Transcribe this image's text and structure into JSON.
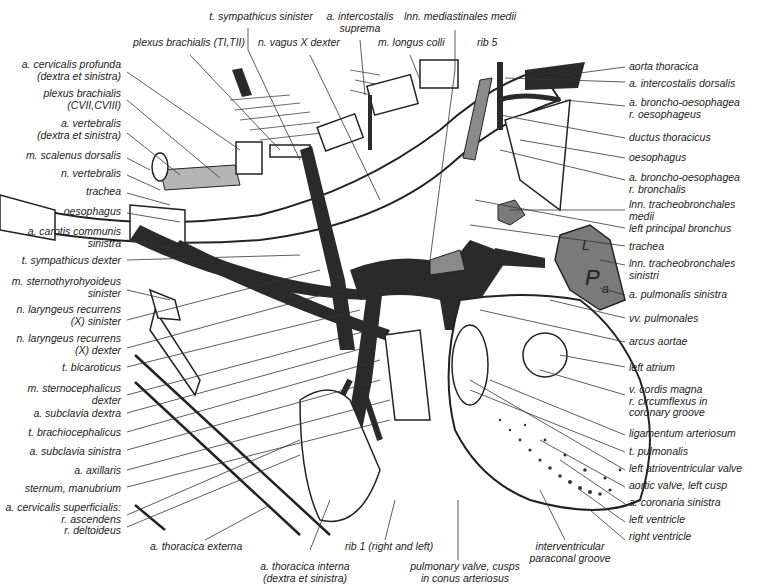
{
  "figure": {
    "colors": {
      "vessel": "#2a2a2a",
      "grey_structure": "#7a7a7a",
      "light_grey": "#b5b5b5",
      "line": "#222222",
      "background": "#ffffff"
    },
    "labels_left": [
      {
        "id": "a-cervicalis-profunda",
        "lines": [
          "a. cervicalis profunda",
          "(dextra et sinistra)"
        ]
      },
      {
        "id": "plexus-brachialis-cvii",
        "lines": [
          "plexus brachialis",
          "(CVII,CVIII)"
        ]
      },
      {
        "id": "a-vertebralis",
        "lines": [
          "a. vertebralis",
          "(dextra et sinistra)"
        ]
      },
      {
        "id": "m-scalenus-dorsalis",
        "lines": [
          "m. scalenus dorsalis"
        ]
      },
      {
        "id": "n-vertebralis",
        "lines": [
          "n. vertebralis"
        ]
      },
      {
        "id": "trachea-left",
        "lines": [
          "trachea"
        ]
      },
      {
        "id": "oesophagus-left",
        "lines": [
          "oesophagus"
        ]
      },
      {
        "id": "a-carotis-communis-sinistra",
        "lines": [
          "a. carotis communis",
          "sinistra"
        ]
      },
      {
        "id": "t-sympathicus-dexter",
        "lines": [
          "t. sympathicus dexter"
        ]
      },
      {
        "id": "m-sternothyrohyoideus",
        "lines": [
          "m. sternothyrohyoideus",
          "sinister"
        ]
      },
      {
        "id": "n-laryngeus-sinister",
        "lines": [
          "n. laryngeus recurrens",
          "(X) sinister"
        ]
      },
      {
        "id": "n-laryngeus-dexter",
        "lines": [
          "n. laryngeus recurrens",
          "(X) dexter"
        ]
      },
      {
        "id": "t-bicaroticus",
        "lines": [
          "t. bicaroticus"
        ]
      },
      {
        "id": "m-sternocephalicus",
        "lines": [
          "m. sternocephalicus",
          "dexter"
        ]
      },
      {
        "id": "a-subclavia-dextra",
        "lines": [
          "a. subclavia dextra"
        ]
      },
      {
        "id": "t-brachiocephalicus",
        "lines": [
          "t. brachiocephalicus"
        ]
      },
      {
        "id": "a-subclavia-sinistra",
        "lines": [
          "a. subclavia sinistra"
        ]
      },
      {
        "id": "a-axillaris",
        "lines": [
          "a. axillaris"
        ]
      },
      {
        "id": "sternum-manubrium",
        "lines": [
          "sternum, manubrium"
        ]
      },
      {
        "id": "a-cervicalis-superficialis",
        "lines": [
          "a. cervicalis superficialis:",
          "r. ascendens",
          "r. deltoideus"
        ]
      }
    ],
    "labels_top": [
      {
        "id": "t-sympathicus-sinister",
        "lines": [
          "t. sympathicus sinister"
        ]
      },
      {
        "id": "plexus-brachialis-ti",
        "lines": [
          "plexus brachialis (TI,TII)"
        ]
      },
      {
        "id": "n-vagus-dexter",
        "lines": [
          "n. vagus X dexter"
        ]
      },
      {
        "id": "a-intercostalis-suprema",
        "lines": [
          "a. intercostalis",
          "suprema"
        ]
      },
      {
        "id": "lnn-mediastinales-medii",
        "lines": [
          "lnn. mediastinales medii"
        ]
      },
      {
        "id": "m-longus-colli",
        "lines": [
          "m. longus colli"
        ]
      },
      {
        "id": "rib-5",
        "lines": [
          "rib 5"
        ]
      }
    ],
    "labels_right": [
      {
        "id": "aorta-thoracica",
        "lines": [
          "aorta thoracica"
        ]
      },
      {
        "id": "a-intercostalis-dorsalis",
        "lines": [
          "a. intercostalis dorsalis"
        ]
      },
      {
        "id": "a-broncho-oesophagea-oes",
        "lines": [
          "a. broncho-oesophagea",
          "r. oesophageus"
        ]
      },
      {
        "id": "ductus-thoracicus",
        "lines": [
          "ductus thoracicus"
        ]
      },
      {
        "id": "oesophagus-right",
        "lines": [
          "oesophagus"
        ]
      },
      {
        "id": "a-broncho-oesophagea-br",
        "lines": [
          "a. broncho-oesophagea",
          "r. bronchalis"
        ]
      },
      {
        "id": "lnn-tracheobronchales-medii",
        "lines": [
          "lnn. tracheobronchales",
          "medii"
        ]
      },
      {
        "id": "left-principal-bronchus",
        "lines": [
          "left principal bronchus"
        ]
      },
      {
        "id": "trachea-right",
        "lines": [
          "trachea"
        ]
      },
      {
        "id": "lnn-tracheobronchales-sinistri",
        "lines": [
          "lnn. tracheobronchales",
          "sinistri"
        ]
      },
      {
        "id": "a-pulmonalis-sinistra",
        "lines": [
          "a. pulmonalis sinistra"
        ]
      },
      {
        "id": "vv-pulmonales",
        "lines": [
          "vv. pulmonales"
        ]
      },
      {
        "id": "arcus-aortae",
        "lines": [
          "arcus aortae"
        ]
      },
      {
        "id": "left-atrium",
        "lines": [
          "left atrium"
        ]
      },
      {
        "id": "v-cordis-magna",
        "lines": [
          "v. cordis magna",
          "r. circumflexus in",
          "coronary groove"
        ]
      },
      {
        "id": "ligamentum-arteriosum",
        "lines": [
          "ligamentum arteriosum"
        ]
      },
      {
        "id": "t-pulmonalis",
        "lines": [
          "t. pulmonalis"
        ]
      },
      {
        "id": "left-atrioventricular-valve",
        "lines": [
          "left atrioventricular valve"
        ]
      },
      {
        "id": "aortic-valve-left-cusp",
        "lines": [
          "aortic valve, left cusp"
        ]
      },
      {
        "id": "a-coronaria-sinistra",
        "lines": [
          "a. coronaria sinistra"
        ]
      },
      {
        "id": "left-ventricle",
        "lines": [
          "left ventricle"
        ]
      },
      {
        "id": "right-ventricle",
        "lines": [
          "right ventricle"
        ]
      }
    ],
    "labels_bottom": [
      {
        "id": "a-thoracica-externa",
        "lines": [
          "a. thoracica externa"
        ]
      },
      {
        "id": "a-thoracica-interna",
        "lines": [
          "a. thoracica  interna",
          "(dextra et sinistra)"
        ]
      },
      {
        "id": "rib-1",
        "lines": [
          "rib 1 (right and left)"
        ]
      },
      {
        "id": "pulmonary-valve",
        "lines": [
          "pulmonary valve, cusps",
          "in conus arteriosus"
        ]
      },
      {
        "id": "interventricular-groove",
        "lines": [
          "interventricular",
          "paraconal groove"
        ]
      }
    ],
    "node_labels": [
      "L",
      "P",
      "a"
    ]
  }
}
